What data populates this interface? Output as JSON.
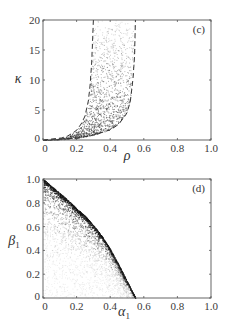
{
  "chart_data": [
    {
      "type": "scatter",
      "panel_label": "(c)",
      "xlabel": "ρ",
      "ylabel": "κ",
      "xlim": [
        0,
        1.0
      ],
      "ylim": [
        0,
        20
      ],
      "xticks": [
        "0",
        "0.2",
        "0.4",
        "0.6",
        "0.8",
        "1.0"
      ],
      "yticks": [
        "0",
        "5",
        "10",
        "15",
        "20"
      ],
      "grid": false,
      "legend": null,
      "boundaries": [
        {
          "name": "lower-rho-bound (dashed)",
          "style": "dashed",
          "points": [
            [
              0,
              0
            ],
            [
              0.05,
              0.05
            ],
            [
              0.1,
              0.25
            ],
            [
              0.15,
              0.7
            ],
            [
              0.2,
              1.6
            ],
            [
              0.23,
              2.8
            ],
            [
              0.25,
              4.0
            ],
            [
              0.27,
              6.5
            ],
            [
              0.28,
              9
            ],
            [
              0.29,
              13
            ],
            [
              0.3,
              20
            ]
          ]
        },
        {
          "name": "upper-rho-bound (dashed)",
          "style": "dashed",
          "points": [
            [
              0,
              0
            ],
            [
              0.1,
              0.08
            ],
            [
              0.2,
              0.3
            ],
            [
              0.3,
              0.8
            ],
            [
              0.4,
              1.7
            ],
            [
              0.45,
              2.6
            ],
            [
              0.5,
              4.5
            ],
            [
              0.52,
              6.5
            ],
            [
              0.535,
              10
            ],
            [
              0.545,
              14
            ],
            [
              0.55,
              20
            ]
          ]
        }
      ],
      "description": "Dense cloud of points filling the region between the two dashed curves; darker near the bottom, lighter toward κ=20"
    },
    {
      "type": "scatter",
      "panel_label": "(d)",
      "xlabel": "α₁",
      "ylabel": "β₁",
      "xlim": [
        0,
        1.0
      ],
      "ylim": [
        0,
        1.0
      ],
      "xticks": [
        "0",
        "0.2",
        "0.4",
        "0.6",
        "0.8",
        "1.0"
      ],
      "yticks": [
        "0",
        "0.2",
        "0.4",
        "0.6",
        "0.8",
        "1.0"
      ],
      "grid": false,
      "legend": null,
      "boundaries": [
        {
          "name": "upper-envelope (dense edge)",
          "style": "points",
          "points": [
            [
              0,
              1.0
            ],
            [
              0.05,
              0.94
            ],
            [
              0.1,
              0.88
            ],
            [
              0.15,
              0.82
            ],
            [
              0.2,
              0.75
            ],
            [
              0.25,
              0.69
            ],
            [
              0.3,
              0.61
            ],
            [
              0.35,
              0.52
            ],
            [
              0.4,
              0.41
            ],
            [
              0.45,
              0.28
            ],
            [
              0.5,
              0.14
            ],
            [
              0.55,
              0.0
            ]
          ]
        }
      ],
      "description": "Points fill the region under a concave curve from (0,1) to (~0.55,0); density highest along the upper edge and fading toward the origin"
    }
  ],
  "panels": {
    "c": {
      "label": "(c)",
      "xlabel": "ρ",
      "ylabel": "κ",
      "xticks": [
        "0",
        "0.2",
        "0.4",
        "0.6",
        "0.8",
        "1.0"
      ],
      "yticks": [
        "0",
        "5",
        "10",
        "15",
        "20"
      ]
    },
    "d": {
      "label": "(d)",
      "xlabel": "α",
      "xlabel_sub": "1",
      "ylabel": "β",
      "ylabel_sub": "1",
      "xticks": [
        "0",
        "0.2",
        "0.4",
        "0.6",
        "0.8",
        "1.0"
      ],
      "yticks": [
        "0",
        "0.2",
        "0.4",
        "0.6",
        "0.8",
        "1.0"
      ]
    }
  }
}
